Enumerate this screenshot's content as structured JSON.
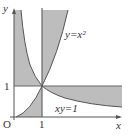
{
  "diagram": {
    "axes": {
      "x_label": "x",
      "y_label": "y",
      "origin_label": "O"
    },
    "ticks": {
      "x_one": "1",
      "y_one": "1"
    },
    "curves": {
      "parabola_label": "y=x²",
      "hyperbola_label": "xy=1"
    },
    "colors": {
      "shade": "#bdbdbd",
      "line": "#555555"
    }
  }
}
